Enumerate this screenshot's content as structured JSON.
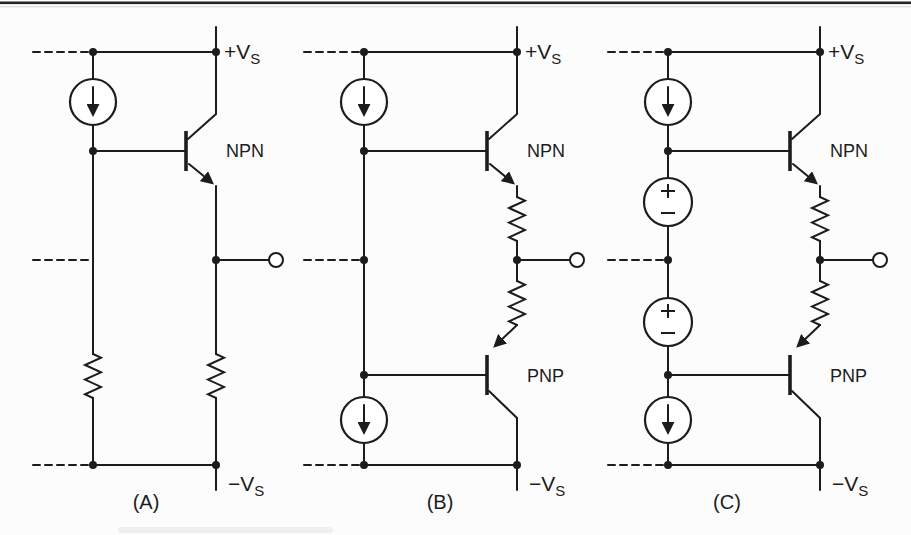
{
  "styles": {
    "ink": "#1c1c1c",
    "paper": "#fcfcfc",
    "top_rule": "#242424"
  },
  "panels": [
    {
      "caption": "(A)",
      "positive_supply": {
        "main": "+V",
        "sub": "S"
      },
      "negative_supply": {
        "main": "−V",
        "sub": "S"
      },
      "npn_label": "NPN",
      "components": [
        "current-source",
        "npn-transistor",
        "resistor",
        "resistor",
        "output-terminal"
      ]
    },
    {
      "caption": "(B)",
      "positive_supply": {
        "main": "+V",
        "sub": "S"
      },
      "negative_supply": {
        "main": "−V",
        "sub": "S"
      },
      "npn_label": "NPN",
      "pnp_label": "PNP",
      "components": [
        "current-source",
        "npn-transistor",
        "emitter-resistor",
        "emitter-resistor",
        "pnp-transistor",
        "current-source",
        "output-terminal"
      ]
    },
    {
      "caption": "(C)",
      "positive_supply": {
        "main": "+V",
        "sub": "S"
      },
      "negative_supply": {
        "main": "−V",
        "sub": "S"
      },
      "npn_label": "NPN",
      "pnp_label": "PNP",
      "components": [
        "current-source",
        "npn-transistor",
        "bias-voltage-source",
        "bias-voltage-source",
        "emitter-resistor",
        "emitter-resistor",
        "pnp-transistor",
        "current-source",
        "output-terminal"
      ]
    }
  ]
}
